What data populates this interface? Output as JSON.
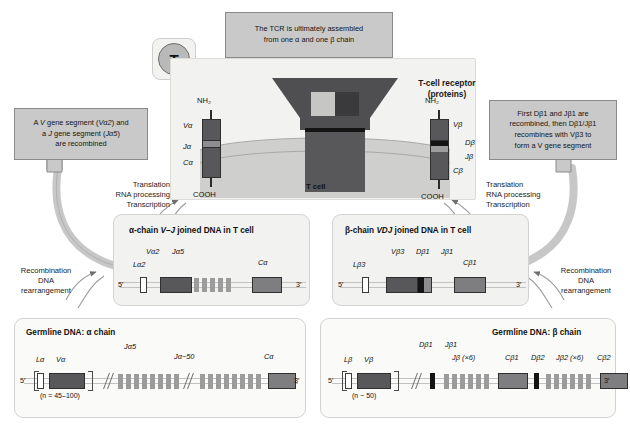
{
  "figure": {
    "badge": {
      "letter": "T"
    },
    "tcr_title_line1": "T-cell receptor",
    "tcr_title_line2": "(proteins)",
    "tcell_label": "T cell",
    "nh2": "NH₂",
    "cooh": "COOH",
    "five_prime": "5′",
    "three_prime": "3′"
  },
  "callouts": {
    "top": {
      "line1": "The TCR is ultimately assembled",
      "line2": "from one α and one β chain"
    },
    "left": {
      "line1_a": "A ",
      "line1_v": "V",
      "line1_b": " gene segment (",
      "line1_vseg": "Vα2",
      "line1_c": ") and",
      "line2_a": "a ",
      "line2_j": "J",
      "line2_b": " gene segment (",
      "line2_jseg": "Jα5",
      "line2_c": ")",
      "line3": "are recombined"
    },
    "right": {
      "line1": "First Dβ1 and Jβ1 are",
      "line2": "recombined, then Dβ1/Jβ1",
      "line3": "recombines with Vβ3 to",
      "line4": "form a V gene segment"
    }
  },
  "processes": {
    "translation": "Translation",
    "rna_processing": "RNA processing",
    "transcription": "Transcription",
    "recombination": "Recombination",
    "dna": "DNA",
    "rearrangement": "rearrangement"
  },
  "alpha_protein": {
    "v": "Vα",
    "j": "Jα",
    "c": "Cα"
  },
  "beta_protein": {
    "v": "Vβ",
    "d": "Dβ",
    "j": "Jβ",
    "c": "Cβ"
  },
  "panels": {
    "alpha_joined": {
      "title_a": "α-chain ",
      "title_i": "V–J",
      "title_b": " joined DNA in T cell",
      "labels": {
        "l": "Lα2",
        "v": "Vα2",
        "j": "Jα5",
        "c": "Cα"
      }
    },
    "beta_joined": {
      "title_a": "β-chain ",
      "title_i": "VDJ",
      "title_b": " joined DNA in T cell",
      "labels": {
        "l": "Lβ3",
        "v": "Vβ3",
        "d": "Dβ1",
        "j": "Jβ1",
        "c": "Cβ1"
      }
    },
    "alpha_germline": {
      "title_a": "Germline DNA: ",
      "title_b": "α chain",
      "labels": {
        "l": "Lα",
        "v": "Vα",
        "n": "(n = 45–100)",
        "j5": "Jα5",
        "j50": "Jα~50",
        "c": "Cα"
      }
    },
    "beta_germline": {
      "title_a": "Germline DNA: ",
      "title_b": "β chain",
      "labels": {
        "l": "Lβ",
        "v": "Vβ",
        "n": "(n ~ 50)",
        "d1": "Dβ1",
        "j1": "Jβ1",
        "jx6": "Jβ (×6)",
        "c1": "Cβ1",
        "d2": "Dβ2",
        "j2x6": "Jβ2 (×6)",
        "c2": "Cβ2"
      }
    }
  },
  "colors": {
    "callout_fill": "#c9c9c9",
    "panel_fill": "#f2f2f0",
    "dark_segment": "#58585a",
    "mid_segment": "#8e8e90",
    "light_segment": "#b7b7b8",
    "black_segment": "#141414",
    "white_segment": "#ffffff",
    "receptor_dark": "#4f4f52",
    "cell_fill": "#c6c6c4"
  }
}
